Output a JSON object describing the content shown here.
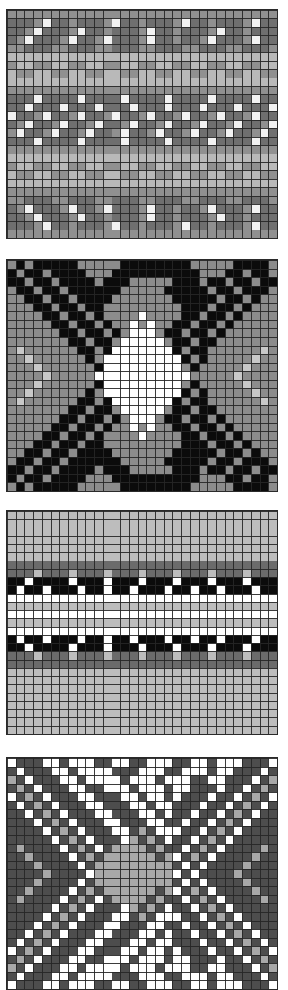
{
  "figure": {
    "background_color": "#ffffff",
    "panel_count": 4,
    "grid_line_color": "#262626",
    "panel_border_color": "#2a2a2a"
  },
  "chart_data": [
    {
      "type": "heatmap",
      "name": "panel-1",
      "title": "",
      "xlabel": "",
      "ylabel": "",
      "grid": true,
      "legend": "none",
      "cols": 31,
      "rows": 27,
      "bounds_px": {
        "x": 6,
        "y": 9,
        "width": 272,
        "height": 230
      },
      "palette": {
        "0": "#909090",
        "1": "#6f6f6f",
        "2": "#f2f2f2",
        "3": "#b9b9b9"
      },
      "palette_names": [
        "mid-gray",
        "dark-gray",
        "white",
        "light-gray"
      ],
      "cells": [
        "0000000000000000000000000000000",
        "1110211011102110111021101110211",
        "1102111021101110211011102110111",
        "1021110211021110211011021110211",
        "0011100111001110011100111001110",
        "3333333333333333333333333333333",
        "0330033003300330033003300330033",
        "3003300330033003300330033003300",
        "3333333333333333333333333333333",
        "0000000000000000000000000000000",
        "1112111121111211112111121111211",
        "1121112111211121112111211121112",
        "2110211021102110211021102110211",
        "1021102110211021102110211021102",
        "0211021102110211021102110211021",
        "1112111121111211112111121111211",
        "0000000000000000000000000000000",
        "3333333333333333333333333333333",
        "0330033003300330033003300330033",
        "3003300330033003300330033003300",
        "3333333333333333333333333333333",
        "0000000000000000000000000000000",
        "0011100111001110011100111001110",
        "1021110211021110211011021110211",
        "1102111021101110211011102110111",
        "1110211011102110111021101110211",
        "0000000000000000000000000000000"
      ]
    },
    {
      "type": "heatmap",
      "name": "panel-2",
      "title": "",
      "xlabel": "",
      "ylabel": "",
      "grid": true,
      "legend": "none",
      "cols": 31,
      "rows": 27,
      "bounds_px": {
        "x": 6,
        "y": 259,
        "width": 272,
        "height": 233
      },
      "palette": {
        "0": "#0b0b0b",
        "1": "#8c8c8c",
        "2": "#ffffff",
        "3": "#5a5a5a",
        "4": "#c8c8c8"
      },
      "palette_names": [
        "black",
        "mid-gray",
        "white",
        "dark-gray",
        "light-gray"
      ],
      "cells": [
        "1010000011111000000001111100001",
        "0100100001110000000000111001001",
        "0010010000100011111000100100100",
        "1001001000000111110000010010001",
        "1100100100001111111000001001011",
        "1110010010011111111100010010111",
        "1111001001011112111100100101111",
        "1111100100101121211001001011111",
        "1111110010010122210010010111111",
        "1111111001001222221001001111111",
        "1411111100102222222010011111141",
        "1141111110122222222201011111411",
        "1114111111022222222210111114111",
        "1111411111222222222221111141111",
        "1114111111022222222210111114111",
        "1141111110122222222201011111411",
        "1411111100102222222010011111141",
        "1111111001001222221001001111111",
        "1111110010010122210010010111111",
        "1111100100101121211001001011111",
        "1111001001011112111100100101111",
        "1110010010011111111100010010111",
        "1100100100001111111000001001011",
        "1001001000000111110000010010001",
        "0010010000100011111000100100100",
        "0100100001110000000000111001001",
        "1010000011111000000001111100001"
      ]
    },
    {
      "type": "heatmap",
      "name": "panel-3",
      "title": "",
      "xlabel": "",
      "ylabel": "",
      "grid": true,
      "legend": "none",
      "cols": 31,
      "rows": 27,
      "bounds_px": {
        "x": 6,
        "y": 510,
        "width": 272,
        "height": 225
      },
      "palette": {
        "0": "#bdbdbd",
        "1": "#6b6b6b",
        "2": "#0b0b0b",
        "3": "#ffffff"
      },
      "palette_names": [
        "light-gray",
        "dark-gray",
        "black",
        "white"
      ],
      "cells": [
        "0000000000000000000000000000000",
        "0000000000000000000000000000000",
        "0000000000000000000000000000000",
        "0000000000000000000000000000000",
        "0000000000000000000000000000000",
        "0000000000000000000000000000000",
        "1111111111111111111111111111111",
        "1110111011101110111011101110111",
        "2232222322232223222322232223222",
        "2322322232232232223223223222322",
        "3333333333333333333333333333333",
        "0000000000000000000000000000000",
        "3333333333333333333333333333333",
        "0000000000000000000000000000000",
        "3333333333333333333333333333333",
        "2322322232232232223223223222322",
        "2232222322232223222322232223222",
        "1110111011101110111011101110111",
        "1111111111111111111111111111111",
        "0000000000000000000000000000000",
        "0000000000000000000000000000000",
        "0000000000000000000000000000000",
        "0000000000000000000000000000000",
        "0000000000000000000000000000000",
        "0000000000000000000000000000000",
        "0000000000000000000000000000000",
        "0000000000000000000000000000000"
      ]
    },
    {
      "type": "heatmap",
      "name": "panel-4",
      "title": "",
      "xlabel": "",
      "ylabel": "",
      "grid": true,
      "legend": "none",
      "cols": 31,
      "rows": 27,
      "bounds_px": {
        "x": 6,
        "y": 757,
        "width": 272,
        "height": 233
      },
      "palette": {
        "0": "#4d4d4d",
        "1": "#ffffff",
        "2": "#a8a8a8",
        "3": "#2a2a2a"
      },
      "palette_names": [
        "dark-gray",
        "white",
        "mid-gray",
        "near-black"
      ],
      "cells": [
        "1000110111001100111001101110001",
        "0100011011110001110011101100010",
        "2010001101111011101110011000102",
        "0201000110011101110110001001020",
        "1020100011000110110100010010201",
        "0102010001100011011000100102010",
        "0010201000110001101001001020100",
        "0001020100011000110010010201000",
        "0000102010001102011100102010000",
        "0000010201000120201001020100000",
        "0200001020102222020010201000020",
        "0020000102022222202102010000200",
        "0002000010222222222010100002000",
        "0000200001222222222101000020000",
        "0002000010222222222010100002000",
        "0020000102022222202102010000200",
        "0200001020102222020010201000020",
        "0000010201000120201001020100000",
        "0000102010001102011100102010000",
        "0001020100011000110010010201000",
        "0010201000110001101001001020100",
        "0102010001100011011000100102010",
        "1020100011000110110100010010201",
        "0201000110011101110110001001020",
        "2010001101111011101110011000102",
        "0100011011110001110011101100010",
        "1000110111001100111001101110001"
      ]
    }
  ]
}
